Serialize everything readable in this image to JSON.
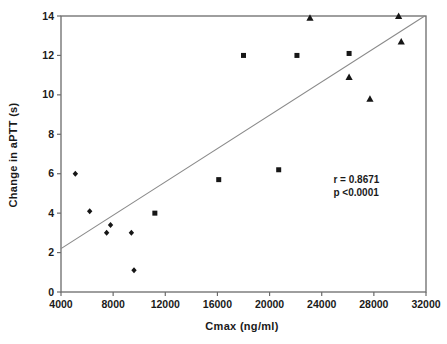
{
  "chart_data": {
    "type": "scatter",
    "title": "",
    "xlabel": "Cmax (ng/ml)",
    "ylabel": "Change in aPTT (s)",
    "xlim": [
      4000,
      32000
    ],
    "ylim": [
      0,
      14
    ],
    "xticks": [
      4000,
      8000,
      12000,
      16000,
      20000,
      24000,
      28000,
      32000
    ],
    "yticks": [
      0,
      2,
      4,
      6,
      8,
      10,
      12,
      14
    ],
    "grid": false,
    "frame": true,
    "legend": "none",
    "series": [
      {
        "name": "diamond-series",
        "marker": "diamond",
        "points": [
          [
            5100,
            6.0
          ],
          [
            6200,
            4.1
          ],
          [
            7500,
            3.0
          ],
          [
            7800,
            3.4
          ],
          [
            9400,
            3.0
          ],
          [
            9600,
            1.1
          ]
        ]
      },
      {
        "name": "square-series",
        "marker": "square",
        "points": [
          [
            11200,
            4.0
          ],
          [
            16100,
            5.7
          ],
          [
            18000,
            12.0
          ],
          [
            20700,
            6.2
          ],
          [
            22100,
            12.0
          ],
          [
            26100,
            12.1
          ]
        ]
      },
      {
        "name": "triangle-series",
        "marker": "triangle",
        "points": [
          [
            23100,
            13.9
          ],
          [
            26100,
            10.9
          ],
          [
            27700,
            9.8
          ],
          [
            29900,
            14.0
          ],
          [
            30100,
            12.7
          ]
        ]
      }
    ],
    "regression_line": {
      "x1": 4000,
      "y1": 2.2,
      "x2": 31900,
      "y2": 14.0
    },
    "annotation": {
      "lines": [
        "r = 0.8671",
        "p <0.0001"
      ],
      "x": 24900,
      "y": 6.05
    },
    "colors": {
      "marker": "#161616",
      "axis": "#6b6b6b",
      "regression": "#8a8a8a",
      "text": "#1a1a1a"
    }
  }
}
